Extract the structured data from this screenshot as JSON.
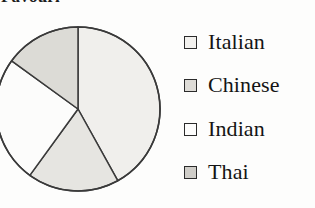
{
  "figure": {
    "title_partial": "Favourite food",
    "type": "pie"
  },
  "chart_data": {
    "type": "pie",
    "title": "Favourite food",
    "categories": [
      "Italian",
      "Chinese",
      "Indian",
      "Thai"
    ],
    "values": [
      42,
      15,
      25,
      18
    ],
    "unit": "percent",
    "start_angle_deg": 0,
    "direction": "clockwise",
    "slices": [
      {
        "label": "Italian",
        "value": 42,
        "start_deg": 0,
        "end_deg": 151,
        "fill": "#f0efec"
      },
      {
        "label": "Thai",
        "value": 18,
        "start_deg": 151,
        "end_deg": 216,
        "fill": "#e6e5e1"
      },
      {
        "label": "Indian",
        "value": 25,
        "start_deg": 216,
        "end_deg": 306,
        "fill": "#fcfcfb"
      },
      {
        "label": "Chinese",
        "value": 15,
        "start_deg": 306,
        "end_deg": 360,
        "fill": "#dcdbd6"
      }
    ],
    "legend_position": "right",
    "grid": false,
    "stroke_color": "#3a3a3a"
  },
  "legend": {
    "items": [
      {
        "label": "Italian",
        "swatch_fill": "#f2f1ee"
      },
      {
        "label": "Chinese",
        "swatch_fill": "#dedcd7"
      },
      {
        "label": "Indian",
        "swatch_fill": "#fdfdfc"
      },
      {
        "label": "Thai",
        "swatch_fill": "#cfcdc8"
      }
    ]
  }
}
